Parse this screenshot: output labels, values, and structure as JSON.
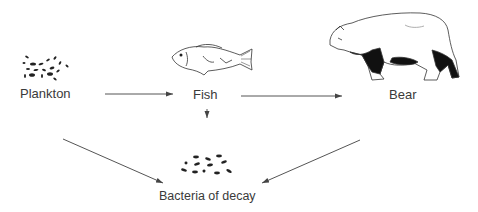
{
  "diagram": {
    "type": "food-chain",
    "nodes": {
      "plankton": {
        "label": "Plankton",
        "icon": "plankton-icon"
      },
      "fish": {
        "label": "Fish",
        "icon": "fish-icon"
      },
      "bear": {
        "label": "Bear",
        "icon": "bear-icon"
      },
      "bacteria": {
        "label": "Bacteria of decay",
        "icon": "bacteria-icon"
      }
    },
    "edges": [
      {
        "from": "Plankton",
        "to": "Fish"
      },
      {
        "from": "Fish",
        "to": "Bear"
      },
      {
        "from": "Fish",
        "to": "Bacteria of decay"
      },
      {
        "from": "Plankton",
        "to": "Bacteria of decay"
      },
      {
        "from": "Bear",
        "to": "Bacteria of decay"
      }
    ],
    "colors": {
      "line": "#555555",
      "ink": "#222222",
      "text": "#3a3a3a"
    }
  }
}
